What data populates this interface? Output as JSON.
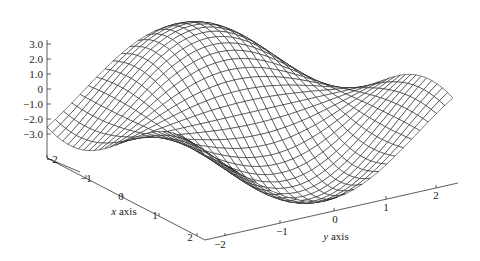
{
  "chart_data": {
    "type": "surface-wireframe",
    "title": "",
    "function_description": "3D wireframe surface over x,y in [-2,2], z roughly in [-3,3], wave/saddle shaped",
    "x": {
      "label": "x axis",
      "range": [
        -2,
        2
      ],
      "ticks": [
        "-2",
        "-1",
        "0",
        "1",
        "2"
      ]
    },
    "y": {
      "label": "y axis",
      "range": [
        -2,
        2
      ],
      "ticks": [
        "-2",
        "-1",
        "0",
        "1",
        "2"
      ]
    },
    "z": {
      "label": "",
      "range": [
        -3,
        3
      ],
      "ticks": [
        "3.0",
        "2.0",
        "1.0",
        "0",
        "-1.0",
        "-2.0",
        "-3.0"
      ]
    },
    "grid": {
      "nx": 30,
      "ny": 30
    },
    "colors": {
      "mesh": "#1a1a1a",
      "fill": "#ffffff",
      "axis": "#333333"
    }
  },
  "labels": {
    "x_axis_title": "x axis",
    "y_axis_title": "y axis",
    "z_ticks": [
      "3.0",
      "2.0",
      "1.0",
      "0",
      "−1.0",
      "−2.0",
      "−3.0"
    ],
    "x_ticks": [
      "−2",
      "−1",
      "0",
      "1",
      "2"
    ],
    "y_ticks": [
      "−2",
      "−1",
      "0",
      "1",
      "2"
    ]
  }
}
